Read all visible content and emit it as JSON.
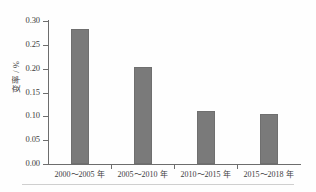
{
  "chart_data": {
    "type": "bar",
    "title": "",
    "xlabel": "",
    "ylabel": "变率 / %",
    "categories": [
      "2000～2005 年",
      "2005～2010 年",
      "2010～2015 年",
      "2015～2018 年"
    ],
    "values": [
      0.284,
      0.203,
      0.111,
      0.104
    ],
    "ylim": [
      0.0,
      0.3
    ],
    "ytick_values": [
      0.0,
      0.05,
      0.1,
      0.15,
      0.2,
      0.25,
      0.3
    ],
    "ytick_labels": [
      "0.00",
      "0.05",
      "0.10",
      "0.15",
      "0.20",
      "0.25",
      "0.30"
    ],
    "grid": false,
    "legend": "none",
    "bar_color": "#7a7a7a",
    "axis_color": "#6d6d6d",
    "background_color": "#ffffff"
  }
}
